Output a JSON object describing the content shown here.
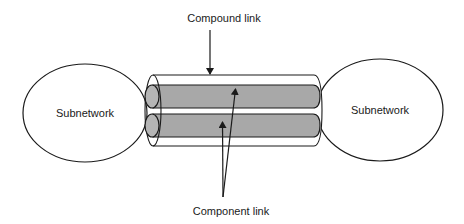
{
  "diagram": {
    "type": "network-link-illustration",
    "nodes": [
      {
        "id": "left",
        "label": "Subnetwork"
      },
      {
        "id": "right",
        "label": "Subnetwork"
      }
    ],
    "labels": {
      "compound": "Compound link",
      "component": "Component link"
    },
    "colors": {
      "background": "#ffffff",
      "stroke": "#1a1a1a",
      "component_fill": "#a8a8a8",
      "end_cap_fill": "#b5b5b5"
    },
    "component_count": 2
  }
}
